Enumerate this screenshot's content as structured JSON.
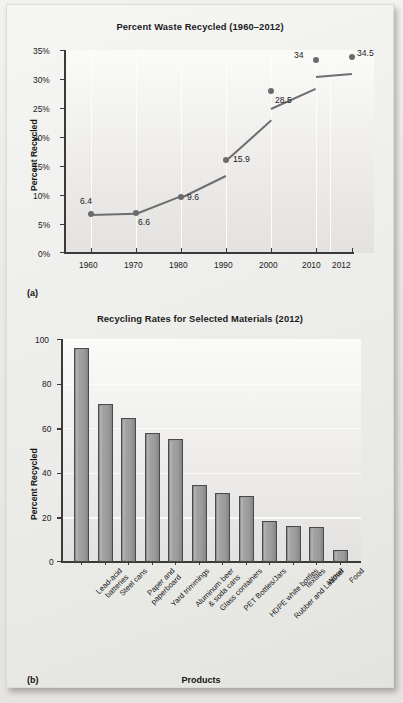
{
  "figure": {
    "panel_a_label": "(a)",
    "panel_b_label": "(b)"
  },
  "chart_data": [
    {
      "type": "line",
      "title": "Percent Waste Recycled (1960–2012)",
      "xlabel": "",
      "ylabel": "Percent Recycled",
      "x": [
        1960,
        1970,
        1980,
        1990,
        2000,
        2010,
        2012
      ],
      "xtick_labels": [
        "1960",
        "1970",
        "1980",
        "1990",
        "2000",
        "2010",
        "2012"
      ],
      "values": [
        6.4,
        6.6,
        9.6,
        15.9,
        28.5,
        34,
        34.5
      ],
      "point_labels": [
        "6.4",
        "6.6",
        "9.6",
        "15.9",
        "28.5",
        "34",
        "34.5"
      ],
      "ytick_labels": [
        "0%",
        "5%",
        "10%",
        "15%",
        "20%",
        "25%",
        "30%",
        "35%"
      ],
      "ytick_values": [
        0,
        5,
        10,
        15,
        20,
        25,
        30,
        35
      ],
      "ylim": [
        0,
        35
      ],
      "grid": "vertical",
      "legend": "none",
      "line_color": "#6e6e6e",
      "marker_color": "#6b6b6b"
    },
    {
      "type": "bar",
      "title": "Recycling Rates for Selected Materials (2012)",
      "xlabel": "Products",
      "ylabel": "Percent Recycled",
      "categories": [
        "Lead-acid\nbatteries",
        "Steel cans",
        "Paper and\npaperboard",
        "Yard trimmings",
        "Aluminum beer\n& soda cans",
        "Glass containers",
        "PET Bottles/Jars",
        "HDPE white bottles",
        "Rubber and Leather",
        "Textiles",
        "Wood",
        "Food"
      ],
      "values": [
        96,
        71,
        64.5,
        58,
        55,
        34.5,
        31,
        29.5,
        18.5,
        16,
        15.5,
        5.5
      ],
      "ytick_labels": [
        "0",
        "20",
        "40",
        "60",
        "80",
        "100"
      ],
      "ytick_values": [
        0,
        20,
        40,
        60,
        80,
        100
      ],
      "ylim": [
        0,
        100
      ],
      "grid": "horizontal",
      "legend": "none",
      "bar_color": "#9a9a9a",
      "bar_edge_color": "#4a4a4a"
    }
  ]
}
